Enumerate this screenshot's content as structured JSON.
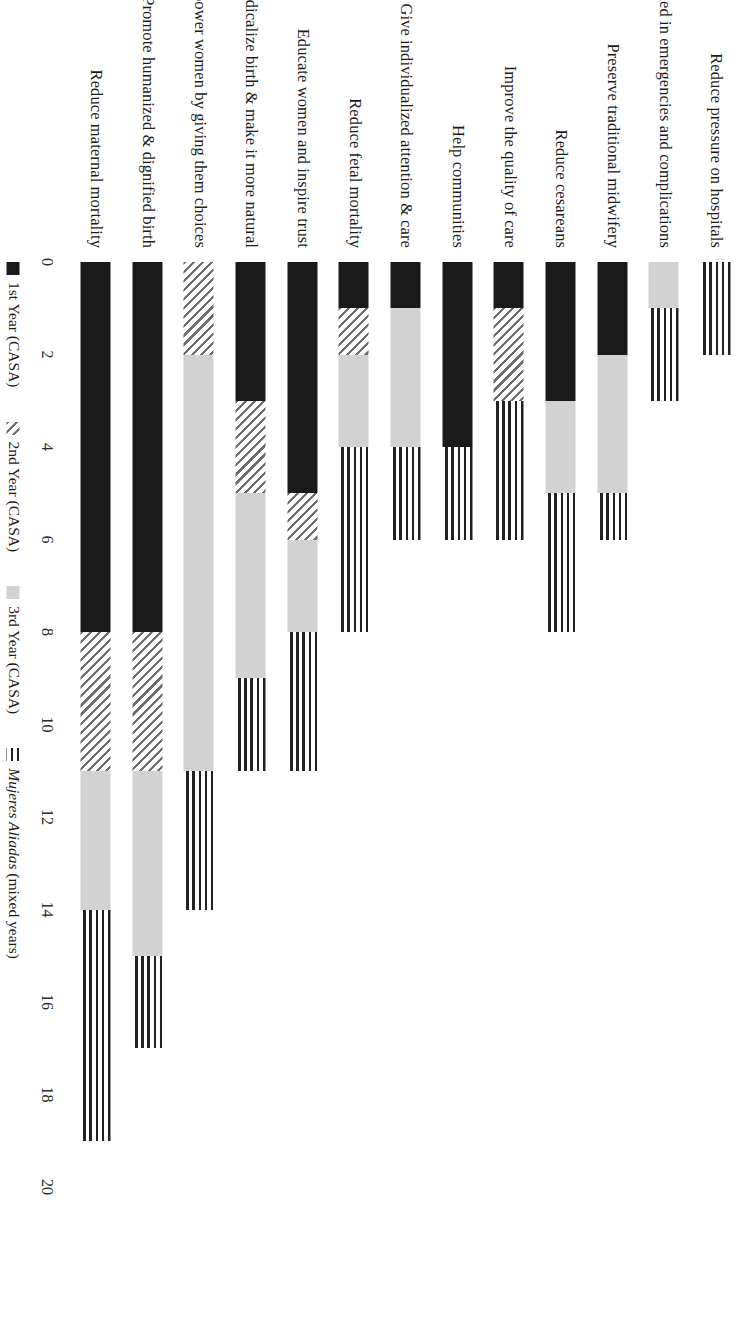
{
  "chart_data": {
    "type": "bar",
    "orientation": "horizontal-stacked",
    "title": "",
    "subtitle": "",
    "xlabel": "",
    "ylabel": "",
    "xlim": [
      0,
      20
    ],
    "xticks": [
      0,
      2,
      4,
      6,
      8,
      10,
      12,
      14,
      16,
      18,
      20
    ],
    "grid": false,
    "legend_position": "bottom",
    "categories": [
      "Reduce pressure on hospitals",
      "Trained in emergencies and complications",
      "Preserve traditional midwifery",
      "Reduce cesareans",
      "Improve the quality of care",
      "Help communities",
      "Give individualized attention & care",
      "Reduce fetal mortality",
      "Educate women and inspire trust",
      "De-medicalize birth & make it more natural",
      "Empower women by giving them choices",
      "Promote humanized & dignified birth",
      "Reduce maternal mortality"
    ],
    "series": [
      {
        "name": "1st Year (CASA)",
        "color": "#1a1a1a",
        "pattern": "solid",
        "values": [
          0,
          0,
          2,
          3,
          1,
          4,
          1,
          1,
          5,
          3,
          0,
          8,
          8
        ]
      },
      {
        "name": "2nd Year (CASA)",
        "color": "#6d6d6d",
        "pattern": "diagonal-hatch",
        "values": [
          0,
          0,
          0,
          0,
          2,
          0,
          0,
          1,
          1,
          2,
          2,
          3,
          3
        ]
      },
      {
        "name": "3rd Year (CASA)",
        "color": "#d2d2d2",
        "pattern": "solid-light",
        "values": [
          0,
          1,
          3,
          2,
          0,
          0,
          3,
          2,
          2,
          4,
          9,
          4,
          3
        ]
      },
      {
        "name": "Mujeres Aliadas (mixed years)",
        "color": "#222222",
        "pattern": "horizontal-lines",
        "values": [
          2,
          2,
          1,
          3,
          3,
          2,
          2,
          4,
          3,
          2,
          3,
          2,
          5
        ]
      }
    ],
    "totals": [
      2,
      3,
      6,
      8,
      6,
      6,
      6,
      8,
      11,
      11,
      14,
      17,
      19
    ]
  },
  "legend": {
    "items": [
      {
        "label": "1st Year (CASA)",
        "label_italic": "",
        "swatch": "solid-black-swatch"
      },
      {
        "label": "2nd Year (CASA)",
        "label_italic": "",
        "swatch": "diagonal-hatch-swatch"
      },
      {
        "label": "3rd Year (CASA)",
        "label_italic": "",
        "swatch": "light-grey-swatch"
      },
      {
        "label": " (mixed years)",
        "label_italic": "Mujeres Aliadas",
        "swatch": "horizontal-lines-swatch"
      }
    ]
  },
  "axis": {
    "ticks": [
      "0",
      "2",
      "4",
      "6",
      "8",
      "10",
      "12",
      "14",
      "16",
      "18",
      "20"
    ]
  }
}
